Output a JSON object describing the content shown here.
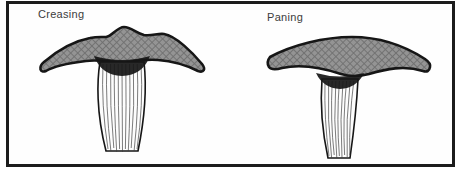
{
  "figure": {
    "labels": {
      "left": "Creasing",
      "right": "Paning"
    }
  },
  "colors": {
    "page_background": "#ffffff",
    "frame": "#1c1c1c",
    "head_fill": "#949494",
    "head_hatch": "#6f6f6f",
    "outline": "#161616",
    "handle_fill": "#fdfdfd",
    "grain": "#3f3f3f",
    "label_text": "#3c3c3c"
  }
}
